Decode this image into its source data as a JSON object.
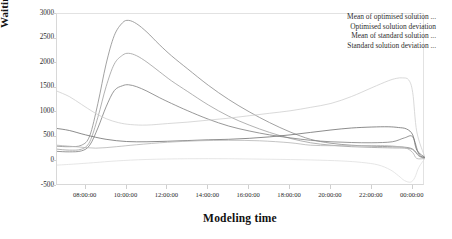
{
  "chart_data": {
    "type": "line",
    "title": "",
    "xlabel": "Modeling time",
    "ylabel": "Waiting time(s)",
    "ylim": [
      -500,
      3000
    ],
    "ytick_labels": [
      "3000",
      "2500",
      "2000",
      "1500",
      "1000",
      "500",
      "0",
      "-500"
    ],
    "ytick_values": [
      3000,
      2500,
      2000,
      1500,
      1000,
      500,
      0,
      -500
    ],
    "xtick_labels": [
      "08:00:00",
      "10:00:00",
      "12:00:00",
      "14:00:00",
      "16:00:00",
      "18:00:00",
      "20:00:00",
      "22:00:00",
      "00:00:00"
    ],
    "xtick_hours": [
      8,
      10,
      12,
      14,
      16,
      18,
      20,
      22,
      24
    ],
    "xlim_hours": [
      6.6,
      24.6
    ],
    "grid": false,
    "legend_position": "top-right",
    "legend": [
      "Mean of optimised solution ...",
      "Optimised solution deviation",
      "Mean of standard solution ...",
      "Standard solution deviation ..."
    ],
    "series": [
      {
        "name": "Mean of optimised solution ...",
        "color": "#8a8a8a",
        "x": [
          6.6,
          7.2,
          7.8,
          8.2,
          8.6,
          9.0,
          9.4,
          9.8,
          10.1,
          10.5,
          11.0,
          11.6,
          12.2,
          13.0,
          14.0,
          15.0,
          16.0,
          17.0,
          18.0,
          19.0,
          20.0,
          21.0,
          22.0,
          23.0,
          23.6,
          24.0,
          24.3,
          24.6
        ],
        "y": [
          310,
          300,
          330,
          520,
          1180,
          1980,
          2560,
          2820,
          2870,
          2800,
          2630,
          2380,
          2150,
          1880,
          1550,
          1260,
          1010,
          790,
          600,
          450,
          370,
          330,
          310,
          300,
          290,
          250,
          120,
          70
        ]
      },
      {
        "name": "Optimised solution deviation",
        "color": "#9e9e9e",
        "x": [
          6.6,
          7.2,
          7.8,
          8.2,
          8.6,
          9.0,
          9.4,
          9.8,
          10.1,
          10.5,
          11.0,
          11.6,
          12.2,
          13.0,
          14.0,
          15.0,
          16.0,
          17.0,
          18.0,
          19.0,
          20.0,
          21.0,
          22.0,
          23.0,
          23.6,
          24.0,
          24.3,
          24.6
        ],
        "y": [
          250,
          230,
          250,
          400,
          900,
          1520,
          1980,
          2160,
          2200,
          2150,
          2020,
          1830,
          1640,
          1420,
          1150,
          920,
          740,
          590,
          470,
          380,
          330,
          300,
          285,
          275,
          270,
          240,
          110,
          60
        ]
      },
      {
        "name": "Mean of standard solution ...",
        "color": "#7d7d7d",
        "x": [
          6.6,
          7.2,
          7.8,
          8.2,
          8.6,
          9.0,
          9.4,
          9.8,
          10.1,
          10.5,
          11.0,
          11.6,
          12.2,
          13.0,
          14.0,
          15.0,
          16.0,
          17.0,
          18.0,
          19.0,
          20.0,
          21.0,
          22.0,
          23.0,
          23.6,
          24.0,
          24.3,
          24.6
        ],
        "y": [
          205,
          195,
          215,
          330,
          680,
          1110,
          1440,
          1540,
          1560,
          1520,
          1430,
          1300,
          1180,
          1030,
          860,
          720,
          620,
          540,
          480,
          430,
          400,
          385,
          380,
          400,
          480,
          500,
          150,
          80
        ]
      },
      {
        "name": "Standard solution deviation ...",
        "color": "#cfcfcf",
        "x": [
          6.6,
          7.2,
          7.8,
          8.4,
          9.0,
          9.6,
          10.2,
          11.0,
          12.0,
          13.0,
          14.0,
          15.0,
          16.0,
          17.0,
          18.0,
          19.0,
          20.0,
          21.0,
          22.0,
          22.8,
          23.2,
          23.5,
          23.8,
          24.0,
          24.2,
          24.6
        ],
        "y": [
          1430,
          1320,
          1160,
          1000,
          870,
          790,
          750,
          740,
          770,
          800,
          840,
          880,
          930,
          980,
          1030,
          1100,
          1180,
          1320,
          1500,
          1640,
          1690,
          1700,
          1660,
          1400,
          600,
          80
        ]
      },
      {
        "name": "standard-mean-flat",
        "color": "#6f6f6f",
        "x": [
          6.6,
          7.2,
          8.0,
          9.0,
          10.0,
          11.0,
          12.0,
          13.0,
          14.0,
          15.0,
          16.0,
          17.0,
          18.0,
          19.0,
          20.0,
          21.0,
          22.0,
          22.8,
          23.3,
          23.7,
          24.0,
          24.2,
          24.6
        ],
        "y": [
          670,
          630,
          540,
          450,
          405,
          400,
          410,
          425,
          440,
          450,
          470,
          500,
          540,
          590,
          640,
          680,
          700,
          705,
          690,
          660,
          540,
          230,
          80
        ]
      },
      {
        "name": "optimised-deviation-low",
        "color": "#b5b5b5",
        "x": [
          6.6,
          7.5,
          8.5,
          9.5,
          10.5,
          12.0,
          13.5,
          15.0,
          16.5,
          18.0,
          19.0,
          20.0,
          21.0,
          22.0,
          22.8,
          23.3,
          23.7,
          24.0,
          24.2,
          24.6
        ],
        "y": [
          330,
          300,
          270,
          300,
          340,
          390,
          420,
          430,
          420,
          380,
          330,
          320,
          320,
          325,
          320,
          300,
          270,
          180,
          60,
          60
        ]
      },
      {
        "name": "standard-deviation-baseline",
        "color": "#e0e0e0",
        "x": [
          6.6,
          7.4,
          8.4,
          9.5,
          11.0,
          13.0,
          15.0,
          17.0,
          19.0,
          20.5,
          21.5,
          22.3,
          22.9,
          23.3,
          23.6,
          23.9,
          24.1,
          24.3,
          24.6
        ],
        "y": [
          -75,
          -55,
          -25,
          10,
          40,
          55,
          55,
          45,
          30,
          10,
          -20,
          -70,
          -170,
          -290,
          -390,
          -420,
          -330,
          -120,
          60
        ]
      }
    ]
  }
}
